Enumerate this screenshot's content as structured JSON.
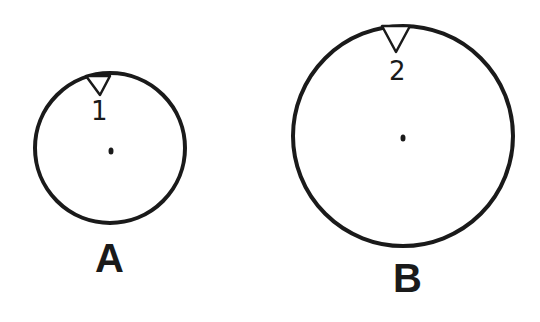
{
  "diagram": {
    "circles": [
      {
        "id": "A",
        "label": "A",
        "marker_number": "1",
        "relative_size": "small"
      },
      {
        "id": "B",
        "label": "B",
        "marker_number": "2",
        "relative_size": "large"
      }
    ],
    "colors": {
      "stroke": "#1a1a1a",
      "background": "#ffffff"
    }
  }
}
